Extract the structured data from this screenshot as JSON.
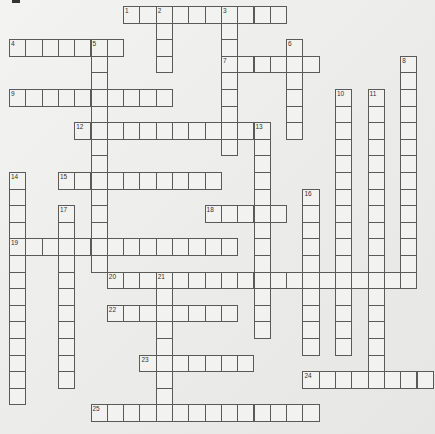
{
  "puzzle": {
    "type": "crossword",
    "cell_size": 16.3,
    "row_size": 16.6,
    "origin": {
      "x": 9,
      "y": 6
    },
    "line_color": "#5a5a5a",
    "cell_color": "#f2f2f0",
    "entries": [
      {
        "number": 1,
        "direction": "across",
        "row": 0,
        "col": 7,
        "length": 10
      },
      {
        "number": 2,
        "direction": "down",
        "row": 0,
        "col": 9,
        "length": 4
      },
      {
        "number": 3,
        "direction": "down",
        "row": 0,
        "col": 13,
        "length": 9
      },
      {
        "number": 4,
        "direction": "across",
        "row": 2,
        "col": 0,
        "length": 7
      },
      {
        "number": 5,
        "direction": "down",
        "row": 2,
        "col": 5,
        "length": 14
      },
      {
        "number": 6,
        "direction": "down",
        "row": 2,
        "col": 17,
        "length": 6
      },
      {
        "number": 7,
        "direction": "across",
        "row": 3,
        "col": 13,
        "length": 6
      },
      {
        "number": 8,
        "direction": "down",
        "row": 3,
        "col": 24,
        "length": 14
      },
      {
        "number": 9,
        "direction": "across",
        "row": 5,
        "col": 0,
        "length": 10
      },
      {
        "number": 10,
        "direction": "down",
        "row": 5,
        "col": 20,
        "length": 16
      },
      {
        "number": 11,
        "direction": "down",
        "row": 5,
        "col": 22,
        "length": 18
      },
      {
        "number": 12,
        "direction": "across",
        "row": 7,
        "col": 4,
        "length": 12
      },
      {
        "number": 13,
        "direction": "down",
        "row": 7,
        "col": 15,
        "length": 13
      },
      {
        "number": 14,
        "direction": "down",
        "row": 10,
        "col": 0,
        "length": 14
      },
      {
        "number": 15,
        "direction": "across",
        "row": 10,
        "col": 3,
        "length": 10
      },
      {
        "number": 16,
        "direction": "down",
        "row": 11,
        "col": 18,
        "length": 10
      },
      {
        "number": 17,
        "direction": "down",
        "row": 12,
        "col": 3,
        "length": 11
      },
      {
        "number": 18,
        "direction": "across",
        "row": 12,
        "col": 12,
        "length": 5
      },
      {
        "number": 19,
        "direction": "across",
        "row": 14,
        "col": 0,
        "length": 14
      },
      {
        "number": 20,
        "direction": "across",
        "row": 16,
        "col": 6,
        "length": 19
      },
      {
        "number": 21,
        "direction": "down",
        "row": 16,
        "col": 9,
        "length": 9
      },
      {
        "number": 22,
        "direction": "across",
        "row": 18,
        "col": 6,
        "length": 8
      },
      {
        "number": 23,
        "direction": "across",
        "row": 21,
        "col": 8,
        "length": 7
      },
      {
        "number": 24,
        "direction": "across",
        "row": 22,
        "col": 18,
        "length": 8
      },
      {
        "number": 25,
        "direction": "across",
        "row": 24,
        "col": 5,
        "length": 14
      }
    ]
  }
}
